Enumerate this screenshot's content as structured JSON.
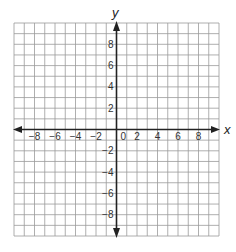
{
  "chart_data": {
    "type": "scatter",
    "title": "",
    "xlabel": "x",
    "ylabel": "y",
    "xlim": [
      -10,
      10
    ],
    "ylim": [
      -10,
      10
    ],
    "grid": true,
    "grid_step": 1,
    "x_ticks": [
      -8,
      -6,
      -4,
      -2,
      0,
      2,
      4,
      6,
      8
    ],
    "y_ticks": [
      -8,
      -6,
      -4,
      -2,
      2,
      4,
      6,
      8
    ],
    "x_tick_labels": [
      "−8",
      "−6",
      "−4",
      "−2",
      "0",
      "2",
      "4",
      "6",
      "8"
    ],
    "y_tick_labels": [
      "−8",
      "−6",
      "−4",
      "−2",
      "2",
      "4",
      "6",
      "8"
    ],
    "series": [],
    "colors": {
      "grid": "#9a9a9a",
      "axis": "#222222",
      "background": "#ffffff"
    }
  }
}
